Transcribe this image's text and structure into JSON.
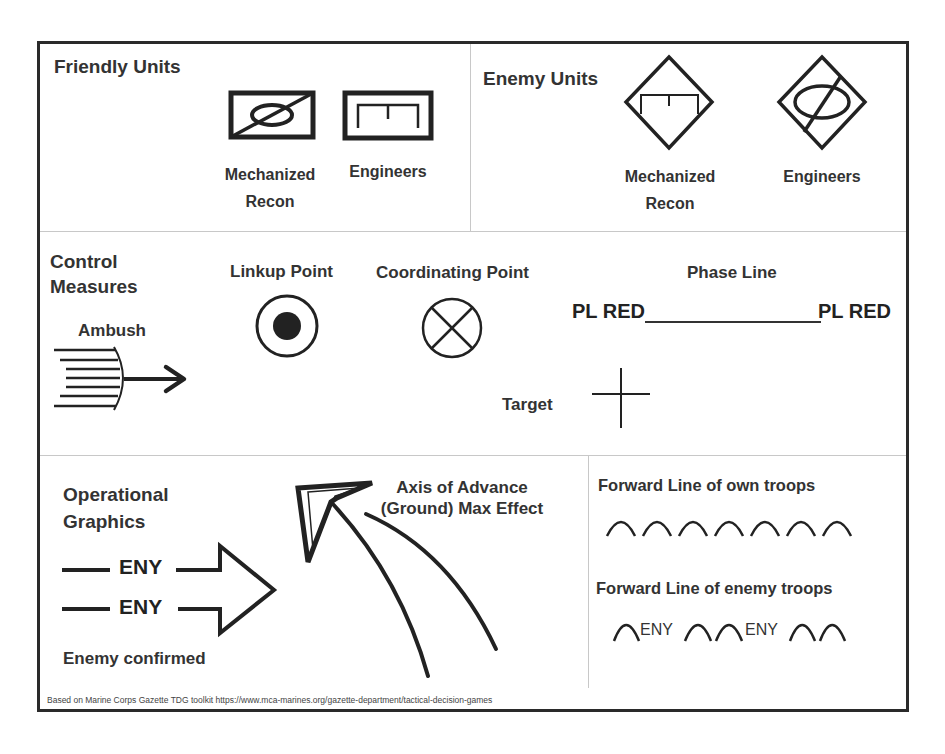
{
  "title_fragment": "...y ...y ...y ...g",
  "sections": {
    "friendly_units": {
      "heading": "Friendly Units",
      "symbols": [
        {
          "label_line1": "Mechanized",
          "label_line2": "Recon",
          "icon": "friendly-mechanized-recon-icon"
        },
        {
          "label_line1": "Engineers",
          "label_line2": "",
          "icon": "friendly-engineers-icon"
        }
      ]
    },
    "enemy_units": {
      "heading": "Enemy Units",
      "symbols": [
        {
          "label_line1": "Mechanized",
          "label_line2": "Recon",
          "icon": "enemy-engineers-diamond-icon"
        },
        {
          "label_line1": "Engineers",
          "label_line2": "",
          "icon": "enemy-mechanized-recon-diamond-icon"
        }
      ]
    },
    "control_measures": {
      "heading_line1": "Control",
      "heading_line2": "Measures",
      "ambush": {
        "label": "Ambush",
        "icon": "ambush-icon"
      },
      "linkup_point": {
        "label": "Linkup Point",
        "icon": "linkup-point-icon"
      },
      "coordinating_point": {
        "label": "Coordinating Point",
        "icon": "coordinating-point-icon"
      },
      "phase_line": {
        "label": "Phase Line",
        "left_tag": "PL RED",
        "right_tag": "PL RED"
      },
      "target": {
        "label": "Target",
        "icon": "target-cross-icon"
      }
    },
    "operational_graphics": {
      "heading_line1": "Operational",
      "heading_line2": "Graphics",
      "enemy_confirmed": {
        "label": "Enemy confirmed",
        "line1_tag": "ENY",
        "line2_tag": "ENY"
      },
      "axis_of_advance": {
        "label_line1": "Axis of Advance",
        "label_line2": "(Ground) Max Effect"
      },
      "flot_own": {
        "label": "Forward Line of own troops",
        "arc_count": 7
      },
      "flot_enemy": {
        "label": "Forward Line of enemy troops",
        "tag1": "ENY",
        "tag2": "ENY"
      }
    }
  },
  "footer": {
    "source_text": "Based on Marine Corps Gazette  TDG toolkit https://www.mca-marines.org/gazette-department/tactical-decision-games"
  },
  "colors": {
    "ink": "#222222",
    "frame": "#2a2a2a",
    "divider": "#c8c8c8",
    "background": "#ffffff"
  }
}
